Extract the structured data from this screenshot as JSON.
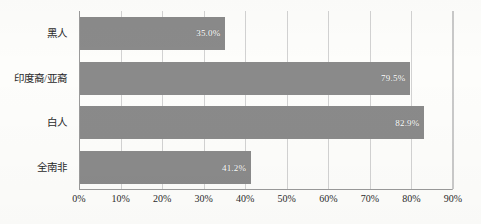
{
  "chart_data": {
    "type": "bar",
    "orientation": "horizontal",
    "title": "",
    "xlabel": "",
    "ylabel": "",
    "categories": [
      "黑人",
      "印度裔/亚裔",
      "白人",
      "全南非"
    ],
    "values": [
      35.0,
      79.5,
      82.9,
      41.2
    ],
    "value_labels": [
      "35.0%",
      "79.5%",
      "82.9%",
      "41.2%"
    ],
    "xlim": [
      0,
      90
    ],
    "xticks": [
      0,
      10,
      20,
      30,
      40,
      50,
      60,
      70,
      80,
      90
    ],
    "xtick_labels": [
      "0%",
      "10%",
      "20%",
      "30%",
      "40%",
      "50%",
      "60%",
      "70%",
      "80%",
      "90%"
    ],
    "grid": "vertical",
    "legend": null,
    "bar_color": "#8a8a8a",
    "value_label_color": "#ffffff",
    "axis_color": "#9a9a9a",
    "gridline_color": "#d2d2d2",
    "background_color": "#fdfdfb"
  }
}
